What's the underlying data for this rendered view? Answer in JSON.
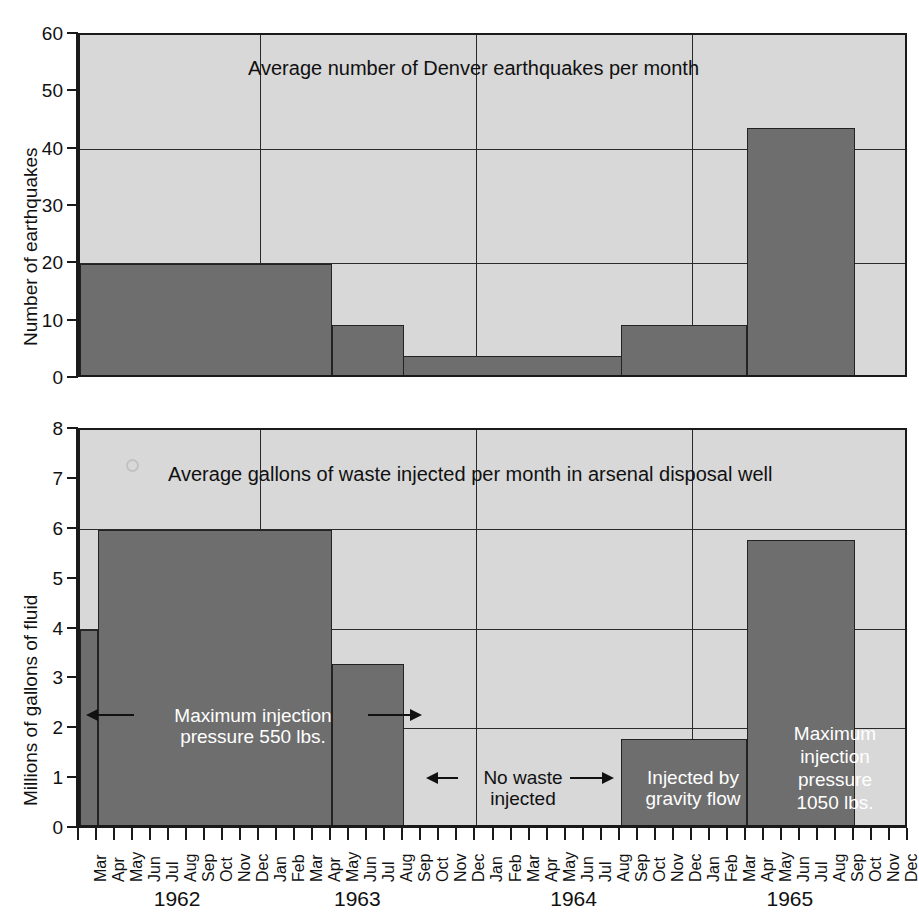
{
  "figure": {
    "background": "#ffffff",
    "bar_color": "#6e6e6e",
    "plot_background": "#d8d8d8",
    "axis_color": "#1a1a1a"
  },
  "months": [
    "Mar",
    "Apr",
    "May",
    "Jun",
    "Jul",
    "Aug",
    "Sep",
    "Oct",
    "Nov",
    "Dec",
    "Jan",
    "Feb",
    "Mar",
    "Apr",
    "May",
    "Jun",
    "Jul",
    "Aug",
    "Sep",
    "Oct",
    "Nov",
    "Dec",
    "Jan",
    "Feb",
    "Mar",
    "Apr",
    "May",
    "Jun",
    "Jul",
    "Aug",
    "Sep",
    "Oct",
    "Nov",
    "Dec",
    "Jan",
    "Feb",
    "Mar",
    "Apr",
    "May",
    "Jun",
    "Jul",
    "Aug",
    "Sep",
    "Oct",
    "Nov",
    "Dec"
  ],
  "years": [
    {
      "label": "1962",
      "center_index": 5.5
    },
    {
      "label": "1963",
      "center_index": 15.5
    },
    {
      "label": "1964",
      "center_index": 27.5
    },
    {
      "label": "1965",
      "center_index": 39.5
    }
  ],
  "year_boundaries": [
    10,
    22,
    34
  ],
  "top": {
    "ylabel": "Number of earthquakes",
    "title": "Average number of Denver earthquakes per month",
    "yticks": [
      0,
      10,
      20,
      30,
      40,
      50,
      60
    ],
    "gridlines": [
      20,
      40
    ],
    "ylim": [
      0,
      60
    ]
  },
  "bottom": {
    "ylabel": "Millions of gallons of fluid",
    "title": "Average gallons of waste injected per month in arsenal disposal well",
    "yticks": [
      0,
      1,
      2,
      3,
      4,
      5,
      6,
      7,
      8
    ],
    "gridlines": [
      2,
      4,
      6
    ],
    "ylim": [
      0,
      8
    ]
  },
  "annotations": {
    "max_pressure_550": "Maximum injection\npressure 550 lbs.",
    "no_waste": "No waste\ninjected",
    "gravity_flow": "Injected by\ngravity flow",
    "max_pressure_1050": "Maximum\ninjection\npressure\n1050 lbs."
  },
  "chart_data": [
    {
      "type": "bar",
      "title": "Average number of Denver earthquakes per month",
      "xlabel": "",
      "ylabel": "Number of earthquakes",
      "ylim": [
        0,
        60
      ],
      "yticks": [
        0,
        10,
        20,
        30,
        40,
        50,
        60
      ],
      "grid": true,
      "legend": "none",
      "categories": [
        "Mar 1962",
        "Apr 1962",
        "May 1962",
        "Jun 1962",
        "Jul 1962",
        "Aug 1962",
        "Sep 1962",
        "Oct 1962",
        "Nov 1962",
        "Dec 1962",
        "Jan 1963",
        "Feb 1963",
        "Mar 1963",
        "Apr 1963",
        "May 1963",
        "Jun 1963",
        "Jul 1963",
        "Aug 1963",
        "Sep 1963",
        "Oct 1963",
        "Nov 1963",
        "Dec 1963",
        "Jan 1964",
        "Feb 1964",
        "Mar 1964",
        "Apr 1964",
        "May 1964",
        "Jun 1964",
        "Jul 1964",
        "Aug 1964",
        "Sep 1964",
        "Oct 1964",
        "Nov 1964",
        "Dec 1964",
        "Jan 1965",
        "Feb 1965",
        "Mar 1965",
        "Apr 1965",
        "May 1965",
        "Jun 1965",
        "Jul 1965",
        "Aug 1965",
        "Sep 1965",
        "Oct 1965",
        "Nov 1965",
        "Dec 1965"
      ],
      "values": [
        20,
        20,
        20,
        20,
        20,
        20,
        20,
        20,
        20,
        20,
        20,
        20,
        20,
        20,
        9.5,
        9.5,
        9.5,
        9.5,
        4,
        4,
        4,
        4,
        4,
        4,
        4,
        4,
        4,
        4,
        4,
        4,
        9.5,
        9.5,
        9.5,
        9.5,
        9.5,
        9.5,
        9.5,
        43.8,
        43.8,
        43.8,
        43.8,
        43.8,
        43.8,
        0,
        0,
        0
      ],
      "steps": [
        {
          "from": "Mar 1962",
          "to": "Apr 1963",
          "value": 20
        },
        {
          "from": "May 1963",
          "to": "Aug 1963",
          "value": 9.5
        },
        {
          "from": "Sep 1963",
          "to": "Aug 1964",
          "value": 4
        },
        {
          "from": "Sep 1964",
          "to": "Mar 1965",
          "value": 9.5
        },
        {
          "from": "Apr 1965",
          "to": "Sep 1965",
          "value": 43.8
        },
        {
          "from": "Oct 1965",
          "to": "Dec 1965",
          "value": 0
        }
      ]
    },
    {
      "type": "bar",
      "title": "Average gallons of waste injected per month in arsenal disposal well",
      "xlabel": "",
      "ylabel": "Millions of gallons of fluid",
      "ylim": [
        0,
        8
      ],
      "yticks": [
        0,
        1,
        2,
        3,
        4,
        5,
        6,
        7,
        8
      ],
      "grid": true,
      "legend": "none",
      "categories": [
        "Mar 1962",
        "Apr 1962",
        "May 1962",
        "Jun 1962",
        "Jul 1962",
        "Aug 1962",
        "Sep 1962",
        "Oct 1962",
        "Nov 1962",
        "Dec 1962",
        "Jan 1963",
        "Feb 1963",
        "Mar 1963",
        "Apr 1963",
        "May 1963",
        "Jun 1963",
        "Jul 1963",
        "Aug 1963",
        "Sep 1963",
        "Oct 1963",
        "Nov 1963",
        "Dec 1963",
        "Jan 1964",
        "Feb 1964",
        "Mar 1964",
        "Apr 1964",
        "May 1964",
        "Jun 1964",
        "Jul 1964",
        "Aug 1964",
        "Sep 1964",
        "Oct 1964",
        "Nov 1964",
        "Dec 1964",
        "Jan 1965",
        "Feb 1965",
        "Mar 1965",
        "Apr 1965",
        "May 1965",
        "Jun 1965",
        "Jul 1965",
        "Aug 1965",
        "Sep 1965",
        "Oct 1965",
        "Nov 1965",
        "Dec 1965"
      ],
      "values": [
        4,
        6,
        6,
        6,
        6,
        6,
        6,
        6,
        6,
        6,
        6,
        6,
        6,
        6,
        3.3,
        3.3,
        3.3,
        3.3,
        0,
        0,
        0,
        0,
        0,
        0,
        0,
        0,
        0,
        0,
        0,
        0,
        1.8,
        1.8,
        1.8,
        1.8,
        1.8,
        1.8,
        1.8,
        5.8,
        5.8,
        5.8,
        5.8,
        5.8,
        5.8,
        0,
        0,
        0
      ],
      "steps": [
        {
          "from": "Mar 1962",
          "to": "Mar 1962",
          "value": 4
        },
        {
          "from": "Apr 1962",
          "to": "Apr 1963",
          "value": 6
        },
        {
          "from": "May 1963",
          "to": "Sep 1963",
          "value": 3.3
        },
        {
          "from": "Oct 1963",
          "to": "Aug 1964",
          "value": 0
        },
        {
          "from": "Sep 1964",
          "to": "Mar 1965",
          "value": 1.8
        },
        {
          "from": "Apr 1965",
          "to": "Sep 1965",
          "value": 5.8
        },
        {
          "from": "Oct 1965",
          "to": "Dec 1965",
          "value": 0
        }
      ]
    }
  ]
}
